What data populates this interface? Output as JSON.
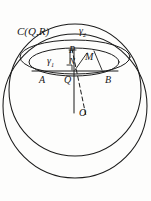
{
  "figure": {
    "stroke_color": "#1b1b1b",
    "background_color": "#fdfdfc",
    "labels": {
      "sphere_center_circle": "C(Q,R)",
      "gamma2": "γ",
      "gamma2_sub": "2",
      "gamma1": "γ",
      "gamma1_sub": "1",
      "point_P": "P",
      "point_N": "N",
      "point_M": "M",
      "point_A": "A",
      "point_Q": "Q",
      "point_B": "B",
      "point_O": "O"
    },
    "elements": [
      {
        "name": "outer-sphere-circle",
        "type": "circle",
        "cx": 75,
        "cy": 104,
        "r": 73
      },
      {
        "name": "secondary-sphere-circle",
        "type": "circle",
        "cx": 75,
        "cy": 92,
        "r": 66
      },
      {
        "name": "gamma2-ellipse",
        "type": "ellipse",
        "cx": 75,
        "cy": 57,
        "rx": 54,
        "ry": 17
      },
      {
        "name": "gamma1-ellipse",
        "type": "ellipse",
        "cx": 74,
        "cy": 62,
        "rx": 44,
        "ry": 14
      },
      {
        "name": "chord-AB",
        "type": "line",
        "x1": 33,
        "y1": 71,
        "x2": 117,
        "y2": 71
      },
      {
        "name": "axis-QO",
        "type": "line",
        "x1": 74,
        "y1": 50,
        "x2": 74,
        "y2": 112
      },
      {
        "name": "dashed-PO",
        "type": "dashed-line",
        "x1": 72,
        "y1": 48,
        "x2": 85,
        "y2": 115
      },
      {
        "name": "segment-PN",
        "type": "line",
        "x1": 71,
        "y1": 49,
        "x2": 71,
        "y2": 62
      },
      {
        "name": "segment-MQ",
        "type": "line",
        "x1": 88,
        "y1": 52,
        "x2": 74,
        "y2": 71
      },
      {
        "name": "segment-M-down",
        "type": "line",
        "x1": 93,
        "y1": 50,
        "x2": 101,
        "y2": 71
      },
      {
        "name": "right-angle-mark",
        "type": "square",
        "x": 67,
        "y": 65,
        "size": 5
      }
    ]
  }
}
